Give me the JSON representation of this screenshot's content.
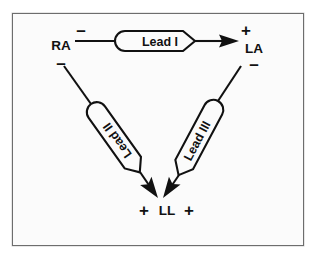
{
  "figure": {
    "background_color": "#fbfbfb",
    "page_color": "#ffffff",
    "stroke_color": "#111111",
    "frame_color": "#6d6d6d"
  },
  "nodes": [
    {
      "id": "RA",
      "label": "RA",
      "polarity_top": "–",
      "polarity_bottom": "–",
      "x": 48,
      "y": 36
    },
    {
      "id": "LA",
      "label": "LA",
      "polarity_top": "+",
      "polarity_bottom": "–",
      "x": 238,
      "y": 36
    },
    {
      "id": "LL",
      "label": "LL",
      "polarity_left": "+",
      "polarity_right": "+",
      "x": 146,
      "y": 196
    }
  ],
  "leads": [
    {
      "id": "lead-1",
      "label": "Lead I",
      "from": "RA",
      "to": "LA",
      "orientation": "horizontal",
      "text_rotation_deg": 0
    },
    {
      "id": "lead-2",
      "label": "Lead II",
      "from": "RA",
      "to": "LL",
      "orientation": "diagonal-down-right",
      "text_rotation_deg": 240
    },
    {
      "id": "lead-3",
      "label": "Lead III",
      "from": "LA",
      "to": "LL",
      "orientation": "diagonal-down-left",
      "text_rotation_deg": 118
    }
  ],
  "icons": {
    "arrowhead": "arrow-head-icon",
    "minus_sign": "minus-sign-icon",
    "plus_sign": "plus-sign-icon"
  }
}
